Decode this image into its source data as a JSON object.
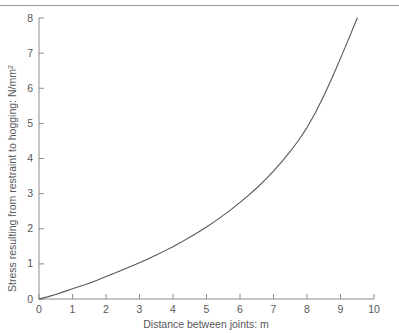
{
  "figure": {
    "top_rule": true,
    "background_color": "#ffffff",
    "axis_color": "#8c8c8f",
    "text_color": "#58585a",
    "curve_color": "#565659"
  },
  "chart_data": {
    "type": "line",
    "title": "",
    "xlabel": "Distance between joints: m",
    "ylabel": "Stress resulting from restraint to hogging: N/mm",
    "ylabel_superscript": "2",
    "xlim": [
      0,
      10
    ],
    "ylim": [
      0,
      8
    ],
    "xticks": [
      0,
      1,
      2,
      3,
      4,
      5,
      6,
      7,
      8,
      9,
      10
    ],
    "xtick_labels": [
      "0",
      "1",
      "2",
      "3",
      "4",
      "5",
      "6",
      "7",
      "8",
      "9",
      "10"
    ],
    "yticks": [
      0,
      1,
      2,
      3,
      4,
      5,
      6,
      7,
      8
    ],
    "ytick_labels": [
      "0",
      "1",
      "2",
      "3",
      "4",
      "5",
      "6",
      "7",
      "8"
    ],
    "grid": false,
    "legend": false,
    "series": [
      {
        "name": "Restraint stress",
        "x": [
          0.0,
          0.25,
          0.5,
          0.75,
          1.0,
          1.25,
          1.5,
          1.75,
          2.0,
          2.25,
          2.5,
          2.75,
          3.0,
          3.25,
          3.5,
          3.75,
          4.0,
          4.25,
          4.5,
          4.75,
          5.0,
          5.25,
          5.5,
          5.75,
          6.0,
          6.25,
          6.5,
          6.75,
          7.0,
          7.25,
          7.5,
          7.75,
          8.0,
          8.25,
          8.5,
          8.75,
          9.0,
          9.25,
          9.5
        ],
        "y": [
          0.0,
          0.06,
          0.13,
          0.21,
          0.29,
          0.37,
          0.45,
          0.54,
          0.64,
          0.73,
          0.83,
          0.93,
          1.03,
          1.14,
          1.25,
          1.37,
          1.49,
          1.62,
          1.76,
          1.9,
          2.05,
          2.21,
          2.38,
          2.56,
          2.75,
          2.95,
          3.16,
          3.39,
          3.64,
          3.91,
          4.2,
          4.52,
          4.88,
          5.3,
          5.78,
          6.3,
          6.85,
          7.42,
          8.0
        ]
      }
    ]
  }
}
